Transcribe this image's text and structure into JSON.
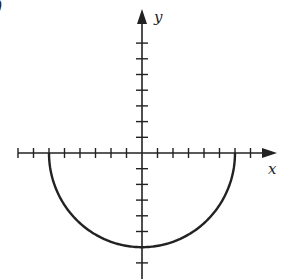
{
  "diagram": {
    "corner_label": ")",
    "x_axis_label": "x",
    "y_axis_label": "y",
    "colors": {
      "ink": "#222222",
      "background": "#ffffff"
    }
  },
  "chart_data": {
    "type": "line",
    "title": "",
    "xlabel": "x",
    "ylabel": "y",
    "xlim": [
      -8,
      7
    ],
    "ylim": [
      -7,
      7
    ],
    "grid": false,
    "tick_step": 1,
    "x_ticks": [
      -8,
      -7,
      -6,
      -5,
      -4,
      -3,
      -2,
      -1,
      1,
      2,
      3,
      4,
      5,
      6,
      7
    ],
    "y_ticks": [
      -7,
      -6,
      -5,
      -4,
      -3,
      -2,
      -1,
      1,
      2,
      3,
      4,
      5,
      6,
      7
    ],
    "series": [
      {
        "name": "y = -sqrt(36 - x^2)",
        "x": [
          -6,
          -5,
          -4,
          -3,
          -2,
          -1,
          0,
          1,
          2,
          3,
          4,
          5,
          6
        ],
        "y": [
          0,
          -3.32,
          -4.47,
          -5.2,
          -5.66,
          -5.92,
          -6,
          -5.92,
          -5.66,
          -5.2,
          -4.47,
          -3.32,
          0
        ]
      }
    ]
  }
}
